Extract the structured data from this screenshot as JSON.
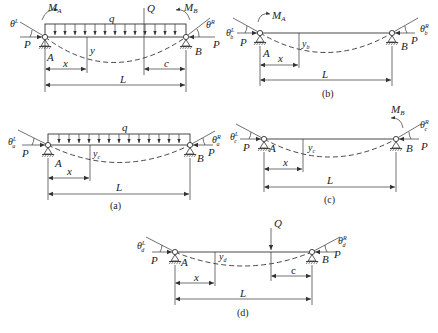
{
  "figure": {
    "panels": [
      {
        "id": "main",
        "caption": "",
        "labels": {
          "moment_left": "M",
          "moment_left_sub": "A",
          "moment_right": "M",
          "moment_right_sub": "B",
          "load": "q",
          "point_load": "Q",
          "theta_left": "θ",
          "theta_left_sup": "L",
          "theta_right": "θ",
          "theta_right_sup": "R",
          "axial_left": "P",
          "axial_right": "P",
          "support_a": "A",
          "support_b": "B",
          "deflection": "y",
          "dim_x": "x",
          "dim_c": "c",
          "dim_L": "L"
        }
      },
      {
        "id": "b",
        "caption": "(b)",
        "labels": {
          "moment_left": "M",
          "moment_left_sub": "A",
          "theta_left": "θ",
          "theta_left_sup": "L",
          "theta_left_sub": "b",
          "theta_right": "θ",
          "theta_right_sup": "R",
          "theta_right_sub": "b",
          "axial_left": "P",
          "axial_right": "P",
          "support_a": "A",
          "support_b": "B",
          "deflection": "y",
          "deflection_sub": "b",
          "dim_x": "x",
          "dim_L": "L"
        }
      },
      {
        "id": "a",
        "caption": "(a)",
        "labels": {
          "load": "q",
          "theta_left": "θ",
          "theta_left_sup": "L",
          "theta_left_sub": "a",
          "theta_right": "θ",
          "theta_right_sup": "R",
          "theta_right_sub": "a",
          "axial_left": "P",
          "axial_right": "P",
          "support_a": "A",
          "support_b": "B",
          "deflection": "y",
          "deflection_sub": "c",
          "dim_x": "x",
          "dim_L": "L"
        }
      },
      {
        "id": "c",
        "caption": "(c)",
        "labels": {
          "moment_right": "M",
          "moment_right_sub": "B",
          "theta_left": "θ",
          "theta_left_sup": "L",
          "theta_left_sub": "c",
          "theta_right": "θ",
          "theta_right_sup": "R",
          "theta_right_sub": "c",
          "axial_left": "P",
          "axial_right": "P",
          "support_a": "A",
          "support_b": "B",
          "deflection": "y",
          "deflection_sub": "c",
          "dim_x": "x",
          "dim_L": "L"
        }
      },
      {
        "id": "d",
        "caption": "(d)",
        "labels": {
          "point_load": "Q",
          "theta_left": "θ",
          "theta_left_sup": "L",
          "theta_left_sub": "d",
          "theta_right": "θ",
          "theta_right_sup": "R",
          "theta_right_sub": "d",
          "axial_left": "P",
          "axial_right": "P",
          "support_a": "A",
          "support_b": "B",
          "deflection": "y",
          "deflection_sub": "d",
          "dim_x": "x",
          "dim_c": "c",
          "dim_L": "L"
        }
      }
    ]
  }
}
